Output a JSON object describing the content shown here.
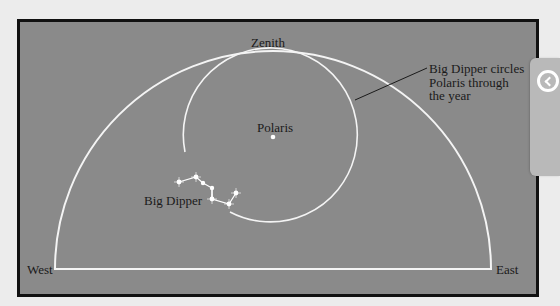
{
  "diagram": {
    "labels": {
      "zenith": "Zenith",
      "polaris": "Polaris",
      "big_dipper": "Big Dipper",
      "west": "West",
      "east": "East",
      "annotation_line1": "Big Dipper circles",
      "annotation_line2": "Polaris through",
      "annotation_line3": "the year"
    },
    "colors": {
      "sky": "#8a8a8a",
      "lines": "#ffffff",
      "frame": "#111111",
      "text": "#1a1a1a"
    }
  },
  "side_panel": {
    "button_icon": "chevron-left-circle-icon"
  }
}
